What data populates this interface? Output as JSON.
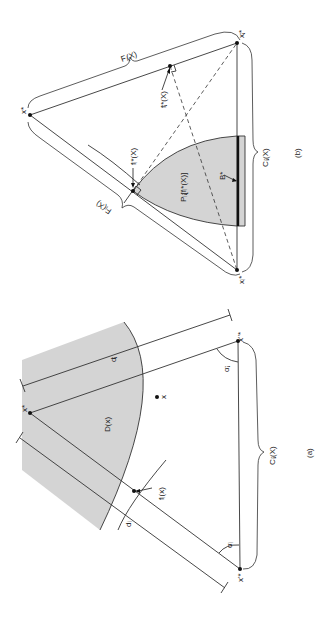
{
  "figure": {
    "orientation": "rotated-90-clockwise",
    "shade_color": "#d4d4d4",
    "line_color": "#333333"
  },
  "panel_b": {
    "caption": "(b)",
    "labels": {
      "x_star": "x*",
      "xj_star": "xⱼ*",
      "xi_star": "xᵢ*",
      "Fj": "Fⱼ(X)",
      "Fi": "Fᵢ(X)",
      "fi_star": "fᵢ*(X)",
      "fj_star": "fⱼ*(X)",
      "Pij": "Pᵢⱼ[fᵢ*(X)]",
      "B_star": "B*",
      "Cij": "Cᵢⱼ(X)"
    }
  },
  "panel_a": {
    "caption": "(a)",
    "labels": {
      "x_star": "x*",
      "xj_pp": "x''*",
      "xi_p": "x'*",
      "D": "D(x)",
      "x_point": "x",
      "fi": "fᵢ(x)",
      "dj": "dⱼ",
      "di": "dᵢ",
      "alpha_j": "αⱼ",
      "alpha_i": "αᵢ",
      "Cij": "Cᵢⱼ(X)"
    }
  }
}
